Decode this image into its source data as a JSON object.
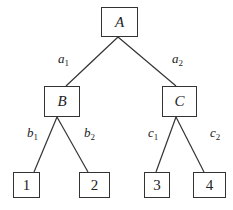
{
  "diagram": {
    "type": "tree",
    "colors": {
      "stroke": "#333333",
      "text": "#222222",
      "background": "#ffffff"
    },
    "nodes": {
      "root": {
        "label": "A"
      },
      "left": {
        "label": "B"
      },
      "right": {
        "label": "C"
      },
      "leaf1": {
        "label": "1"
      },
      "leaf2": {
        "label": "2"
      },
      "leaf3": {
        "label": "3"
      },
      "leaf4": {
        "label": "4"
      }
    },
    "edges": {
      "a1": {
        "base": "a",
        "sub": "1",
        "from": "A",
        "to": "B"
      },
      "a2": {
        "base": "a",
        "sub": "2",
        "from": "A",
        "to": "C"
      },
      "b1": {
        "base": "b",
        "sub": "1",
        "from": "B",
        "to": "1"
      },
      "b2": {
        "base": "b",
        "sub": "2",
        "from": "B",
        "to": "2"
      },
      "c1": {
        "base": "c",
        "sub": "1",
        "from": "C",
        "to": "3"
      },
      "c2": {
        "base": "c",
        "sub": "2",
        "from": "C",
        "to": "4"
      }
    }
  }
}
